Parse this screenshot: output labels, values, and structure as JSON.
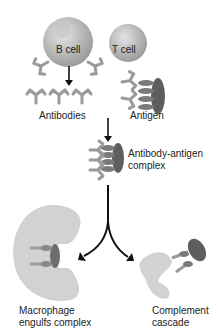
{
  "diagram": {
    "labels": {
      "b_cell": "B cell",
      "t_cell": "T cell",
      "antibodies": "Antibodies",
      "antigen": "Antigen",
      "complex_line1": "Antibody-antigen",
      "complex_line2": "complex",
      "macrophage_line1": "Macrophage",
      "macrophage_line2": "engulfs complex",
      "complement_line1": "Complement",
      "complement_line2": "cascade"
    },
    "colors": {
      "cell": "#b8b8b8",
      "antibody": "#9a9a9a",
      "antigen": "#6e6e6e",
      "macrophage": "#d4d4d4",
      "arrow": "#111111"
    }
  }
}
